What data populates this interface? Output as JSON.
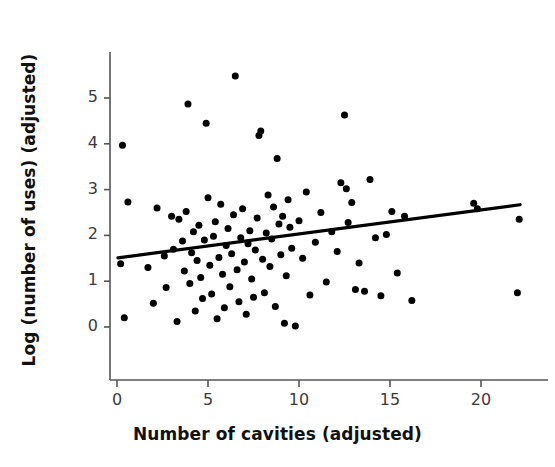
{
  "figure": {
    "background_color": "#ffffff",
    "point_color": "#000000",
    "line_color": "#000000",
    "axis_color": "#555555",
    "tick_text_color": "#3b3b3b",
    "label_text_color": "#111111"
  },
  "axes": {
    "xlabel": "Number of cavities (adjusted)",
    "ylabel": "Log (number of uses) (adjusted)",
    "xticks": [
      "0",
      "5",
      "10",
      "15",
      "20"
    ],
    "yticks": [
      "0",
      "1",
      "2",
      "3",
      "4",
      "5"
    ]
  },
  "chart_data": {
    "type": "scatter",
    "title": "",
    "xlabel": "Number of cavities (adjusted)",
    "ylabel": "Log (number of uses) (adjusted)",
    "xlim": [
      -1.2,
      23.5
    ],
    "ylim": [
      -1.05,
      6.1
    ],
    "xticks": [
      0,
      5,
      10,
      15,
      20
    ],
    "yticks": [
      0,
      1,
      2,
      3,
      4,
      5
    ],
    "grid": false,
    "legend": "none",
    "point_marker": "filled-circle",
    "point_size_px": 7,
    "trendline": {
      "type": "linear-fit",
      "x_start": 0.05,
      "y_start": 1.51,
      "x_end": 22.15,
      "y_end": 2.67,
      "slope": 0.052,
      "intercept": 1.51,
      "color": "#000000",
      "width_px": 3.2
    },
    "n_points": 104,
    "x": [
      0.3,
      0.6,
      0.2,
      0.4,
      1.7,
      2.0,
      2.2,
      2.6,
      2.7,
      3.0,
      3.1,
      3.3,
      3.4,
      3.6,
      3.7,
      3.8,
      3.9,
      4.0,
      4.1,
      4.2,
      4.3,
      4.4,
      4.5,
      4.6,
      4.7,
      4.8,
      4.9,
      5.0,
      5.1,
      5.2,
      5.3,
      5.4,
      5.5,
      5.6,
      5.7,
      5.8,
      5.9,
      6.0,
      6.1,
      6.2,
      6.3,
      6.4,
      6.5,
      6.6,
      6.7,
      6.8,
      6.9,
      7.0,
      7.1,
      7.2,
      7.3,
      7.4,
      7.5,
      7.6,
      7.7,
      7.8,
      7.9,
      8.0,
      8.1,
      8.2,
      8.3,
      8.4,
      8.5,
      8.6,
      8.7,
      8.8,
      8.9,
      9.0,
      9.1,
      9.2,
      9.3,
      9.4,
      9.5,
      9.6,
      9.8,
      10.0,
      10.2,
      10.4,
      10.6,
      10.9,
      11.2,
      11.5,
      11.8,
      12.1,
      12.3,
      12.5,
      12.6,
      12.7,
      12.9,
      13.1,
      13.3,
      13.6,
      13.9,
      14.2,
      14.5,
      14.8,
      15.1,
      15.4,
      15.8,
      16.2,
      19.6,
      19.8,
      22.0,
      22.1
    ],
    "y": [
      3.97,
      2.73,
      1.38,
      0.2,
      1.3,
      0.52,
      2.6,
      1.55,
      0.86,
      2.42,
      1.7,
      0.12,
      2.35,
      1.88,
      1.22,
      2.52,
      4.87,
      0.95,
      1.62,
      2.08,
      0.35,
      1.45,
      2.22,
      1.08,
      0.62,
      1.9,
      4.45,
      2.82,
      1.35,
      0.72,
      1.98,
      2.3,
      0.18,
      1.52,
      2.68,
      1.15,
      0.42,
      1.78,
      2.15,
      0.88,
      1.6,
      2.45,
      5.48,
      1.25,
      0.55,
      1.95,
      2.58,
      1.42,
      0.28,
      1.82,
      2.1,
      1.05,
      0.65,
      1.68,
      2.38,
      4.18,
      4.28,
      1.48,
      0.75,
      2.05,
      2.88,
      1.32,
      1.92,
      2.62,
      0.45,
      3.68,
      2.25,
      1.58,
      2.42,
      0.08,
      1.12,
      2.78,
      2.18,
      1.72,
      0.02,
      2.32,
      1.5,
      2.95,
      0.7,
      1.85,
      2.5,
      0.98,
      2.08,
      1.65,
      3.15,
      4.63,
      3.02,
      2.28,
      2.72,
      0.82,
      1.4,
      0.78,
      3.22,
      1.95,
      0.68,
      2.02,
      2.52,
      1.18,
      2.42,
      0.58,
      2.7,
      2.58,
      0.75,
      2.35
    ],
    "points": [
      [
        0.3,
        3.97
      ],
      [
        0.6,
        2.73
      ],
      [
        0.2,
        1.38
      ],
      [
        0.4,
        0.2
      ],
      [
        1.7,
        1.3
      ],
      [
        2.0,
        0.52
      ],
      [
        2.2,
        2.6
      ],
      [
        2.6,
        1.55
      ],
      [
        2.7,
        0.86
      ],
      [
        3.0,
        2.42
      ],
      [
        3.1,
        1.7
      ],
      [
        3.3,
        0.12
      ],
      [
        3.4,
        2.35
      ],
      [
        3.6,
        1.88
      ],
      [
        3.7,
        1.22
      ],
      [
        3.8,
        2.52
      ],
      [
        3.9,
        4.87
      ],
      [
        4.0,
        0.95
      ],
      [
        4.1,
        1.62
      ],
      [
        4.2,
        2.08
      ],
      [
        4.3,
        0.35
      ],
      [
        4.4,
        1.45
      ],
      [
        4.5,
        2.22
      ],
      [
        4.6,
        1.08
      ],
      [
        4.7,
        0.62
      ],
      [
        4.8,
        1.9
      ],
      [
        4.9,
        4.45
      ],
      [
        5.0,
        2.82
      ],
      [
        5.1,
        1.35
      ],
      [
        5.2,
        0.72
      ],
      [
        5.3,
        1.98
      ],
      [
        5.4,
        2.3
      ],
      [
        5.5,
        0.18
      ],
      [
        5.6,
        1.52
      ],
      [
        5.7,
        2.68
      ],
      [
        5.8,
        1.15
      ],
      [
        5.9,
        0.42
      ],
      [
        6.0,
        1.78
      ],
      [
        6.1,
        2.15
      ],
      [
        6.2,
        0.88
      ],
      [
        6.3,
        1.6
      ],
      [
        6.4,
        2.45
      ],
      [
        6.5,
        5.48
      ],
      [
        6.6,
        1.25
      ],
      [
        6.7,
        0.55
      ],
      [
        6.8,
        1.95
      ],
      [
        6.9,
        2.58
      ],
      [
        7.0,
        1.42
      ],
      [
        7.1,
        0.28
      ],
      [
        7.2,
        1.82
      ],
      [
        7.3,
        2.1
      ],
      [
        7.4,
        1.05
      ],
      [
        7.5,
        0.65
      ],
      [
        7.6,
        1.68
      ],
      [
        7.7,
        2.38
      ],
      [
        7.8,
        4.18
      ],
      [
        7.9,
        4.28
      ],
      [
        8.0,
        1.48
      ],
      [
        8.1,
        0.75
      ],
      [
        8.2,
        2.05
      ],
      [
        8.3,
        2.88
      ],
      [
        8.4,
        1.32
      ],
      [
        8.5,
        1.92
      ],
      [
        8.6,
        2.62
      ],
      [
        8.7,
        0.45
      ],
      [
        8.8,
        3.68
      ],
      [
        8.9,
        2.25
      ],
      [
        9.0,
        1.58
      ],
      [
        9.1,
        2.42
      ],
      [
        9.2,
        0.08
      ],
      [
        9.3,
        1.12
      ],
      [
        9.4,
        2.78
      ],
      [
        9.5,
        2.18
      ],
      [
        9.6,
        1.72
      ],
      [
        9.8,
        0.02
      ],
      [
        10.0,
        2.32
      ],
      [
        10.2,
        1.5
      ],
      [
        10.4,
        2.95
      ],
      [
        10.6,
        0.7
      ],
      [
        10.9,
        1.85
      ],
      [
        11.2,
        2.5
      ],
      [
        11.5,
        0.98
      ],
      [
        11.8,
        2.08
      ],
      [
        12.1,
        1.65
      ],
      [
        12.3,
        3.15
      ],
      [
        12.5,
        4.63
      ],
      [
        12.6,
        3.02
      ],
      [
        12.7,
        2.28
      ],
      [
        12.9,
        2.72
      ],
      [
        13.1,
        0.82
      ],
      [
        13.3,
        1.4
      ],
      [
        13.6,
        0.78
      ],
      [
        13.9,
        3.22
      ],
      [
        14.2,
        1.95
      ],
      [
        14.5,
        0.68
      ],
      [
        14.8,
        2.02
      ],
      [
        15.1,
        2.52
      ],
      [
        15.4,
        1.18
      ],
      [
        15.8,
        2.42
      ],
      [
        16.2,
        0.58
      ],
      [
        19.6,
        2.7
      ],
      [
        19.8,
        2.58
      ],
      [
        22.0,
        0.75
      ],
      [
        22.1,
        2.35
      ]
    ]
  }
}
